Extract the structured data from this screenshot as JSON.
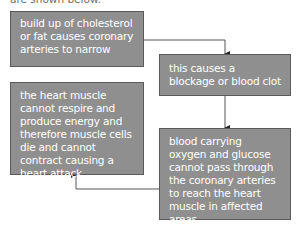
{
  "header": {
    "cut_off_text": "are shown below."
  },
  "flowchart": {
    "boxes": [
      {
        "id": "box1",
        "text": "build up of cholesterol or fat causes coronary arteries to narrow"
      },
      {
        "id": "box2",
        "text": "this causes a blockage or blood clot"
      },
      {
        "id": "box3",
        "text": "blood carrying oxygen and glucose cannot pass through the coronary arteries to reach the heart muscle in affected areas"
      },
      {
        "id": "box4",
        "text": "the heart muscle cannot respire and produce energy and therefore muscle cells die and cannot contract causing a heart attack"
      }
    ],
    "arrows": [
      {
        "from": "box1",
        "to": "box2"
      },
      {
        "from": "box2",
        "to": "box3"
      },
      {
        "from": "box3",
        "to": "box4"
      }
    ],
    "colors": {
      "box_fill": "#8f8f8f",
      "box_border": "#5a5a5a",
      "text": "#ffffff",
      "line": "#333333"
    }
  }
}
